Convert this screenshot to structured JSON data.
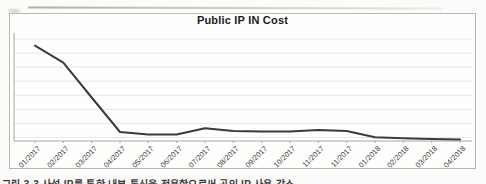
{
  "page": {
    "background_color": "#fbfbf9",
    "frame_border_color": "#b8b8b5"
  },
  "chart_data": {
    "type": "line",
    "title": "Public IP IN Cost",
    "categories": [
      "01/2017",
      "02/2017",
      "03/2017",
      "04/2017",
      "05/2017",
      "06/2017",
      "07/2017",
      "08/2017",
      "09/2017",
      "10/2017",
      "11/2017",
      "11/2017",
      "01/2018",
      "02/2018",
      "03/2018",
      "04/2018"
    ],
    "values": [
      90,
      74,
      41,
      8.5,
      6,
      6,
      12,
      9.5,
      9,
      9,
      10.5,
      9.5,
      3.5,
      2.5,
      2,
      1.5
    ],
    "xlabel": "",
    "ylabel": "",
    "ylim": [
      0,
      100
    ],
    "y_axis_tick_labels_visible": false,
    "grid": true,
    "gridline_count": 8,
    "legend": "none",
    "line_color": "#3b3b3b",
    "gridline_color": "#e7e7e4",
    "axis_color": "#a6a6a3",
    "tick_label_color": "#3f3f3f",
    "title_color": "#1c1c1c",
    "x_tick_rotation": -45,
    "values_note": "relative 0-100 scale; chart shows no y-axis value labels"
  },
  "caption": {
    "text": "그림 3-3 사설 IP를 통한 내부 통신을 적용함으로써 공인 IP 사용 감소",
    "note": "caption is clipped by the bottom edge of the screenshot"
  }
}
